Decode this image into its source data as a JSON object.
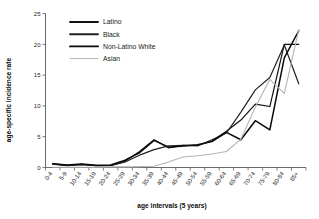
{
  "chart_data": {
    "type": "line",
    "title": "",
    "xlabel": "age intervals (5 years)",
    "ylabel": "age-specific incidence rate",
    "ylim": [
      0,
      25
    ],
    "yticks": [
      0,
      5,
      10,
      15,
      20,
      25
    ],
    "grid": false,
    "legend_position": "upper-left-inside",
    "categories": [
      "0-4",
      "5-9",
      "10-14",
      "15-19",
      "20-24",
      "25-29",
      "30-34",
      "35-39",
      "40-44",
      "45-49",
      "50-54",
      "55-59",
      "60-64",
      "65-69",
      "70-74",
      "75-79",
      "80-84",
      "85+"
    ],
    "series": [
      {
        "name": "Latino",
        "color": "#111111",
        "values": [
          0.6,
          0.35,
          0.5,
          0.3,
          0.35,
          1.0,
          2.6,
          4.5,
          3.2,
          3.6,
          3.6,
          4.3,
          5.9,
          7.7,
          10.3,
          9.9,
          20.0,
          20.0
        ]
      },
      {
        "name": "Black",
        "color": "#222222",
        "values": [
          0.55,
          0.3,
          0.45,
          0.3,
          0.3,
          0.9,
          2.0,
          2.9,
          3.5,
          3.6,
          3.5,
          4.5,
          5.6,
          9.0,
          12.6,
          14.6,
          19.9,
          13.6
        ]
      },
      {
        "name": "Non-Latino White",
        "color": "#0a0a0a",
        "values": [
          0.6,
          0.4,
          0.55,
          0.35,
          0.4,
          1.2,
          2.4,
          4.4,
          3.3,
          3.5,
          3.7,
          4.2,
          5.7,
          4.5,
          7.6,
          6.1,
          17.8,
          22.2
        ]
      },
      {
        "name": "Asian",
        "color": "#b4b4b4",
        "values": [
          0.05,
          0.05,
          0.05,
          0.05,
          0.1,
          0.1,
          0.15,
          0.2,
          0.9,
          1.7,
          1.9,
          2.2,
          2.6,
          4.6,
          9.8,
          14.3,
          12.0,
          22.4
        ]
      }
    ]
  },
  "axes": {
    "y_tick_labels": [
      "0",
      "5",
      "10",
      "15",
      "20",
      "25"
    ],
    "x_tick_labels": [
      "0-4",
      "5-9",
      "10-14",
      "15-19",
      "20-24",
      "25-29",
      "30-34",
      "35-39",
      "40-44",
      "45-49",
      "50-54",
      "55-59",
      "60-64",
      "65-69",
      "70-74",
      "75-79",
      "80-84",
      "85+"
    ],
    "y_axis_title": "age-specific incidence rate",
    "x_axis_title": "age intervals (5 years)"
  },
  "legend": {
    "items": [
      {
        "label": "Latino"
      },
      {
        "label": "Black"
      },
      {
        "label": "Non-Latino White"
      },
      {
        "label": "Asian"
      }
    ]
  }
}
